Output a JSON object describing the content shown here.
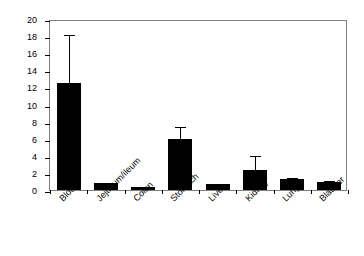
{
  "chart_data": {
    "type": "bar",
    "title": "",
    "xlabel": "",
    "ylabel": "% Specific radioactivity",
    "ylim": [
      0,
      20
    ],
    "ytick_step": 2,
    "yticks": [
      0,
      2,
      4,
      6,
      8,
      10,
      12,
      14,
      16,
      18,
      20
    ],
    "ytick_labels": [
      "0",
      "2",
      "4",
      "6",
      "8",
      "10",
      "12",
      "14",
      "16",
      "18",
      "20"
    ],
    "grid": false,
    "legend": null,
    "error_bars": "upper-only",
    "bar_color": "#000000",
    "frame_color": "#808080",
    "categories": [
      "Blood",
      "Jejunum/ileum",
      "Colon",
      "Stomach",
      "Liver",
      "Kidney",
      "Lung",
      "Bladder"
    ],
    "values": [
      12.5,
      0.8,
      0.4,
      6.0,
      0.65,
      2.3,
      1.25,
      0.9
    ],
    "errors": [
      5.9,
      0.2,
      0.1,
      1.6,
      0.25,
      1.9,
      0.35,
      0.4
    ],
    "upper_bounds": [
      18.4,
      1.0,
      0.5,
      7.6,
      0.9,
      4.2,
      1.6,
      1.3
    ],
    "series": [
      {
        "name": "% Specific radioactivity",
        "values": [
          12.5,
          0.8,
          0.4,
          6.0,
          0.65,
          2.3,
          1.25,
          0.9
        ],
        "errors": [
          5.9,
          0.2,
          0.1,
          1.6,
          0.25,
          1.9,
          0.35,
          0.4
        ]
      }
    ]
  }
}
